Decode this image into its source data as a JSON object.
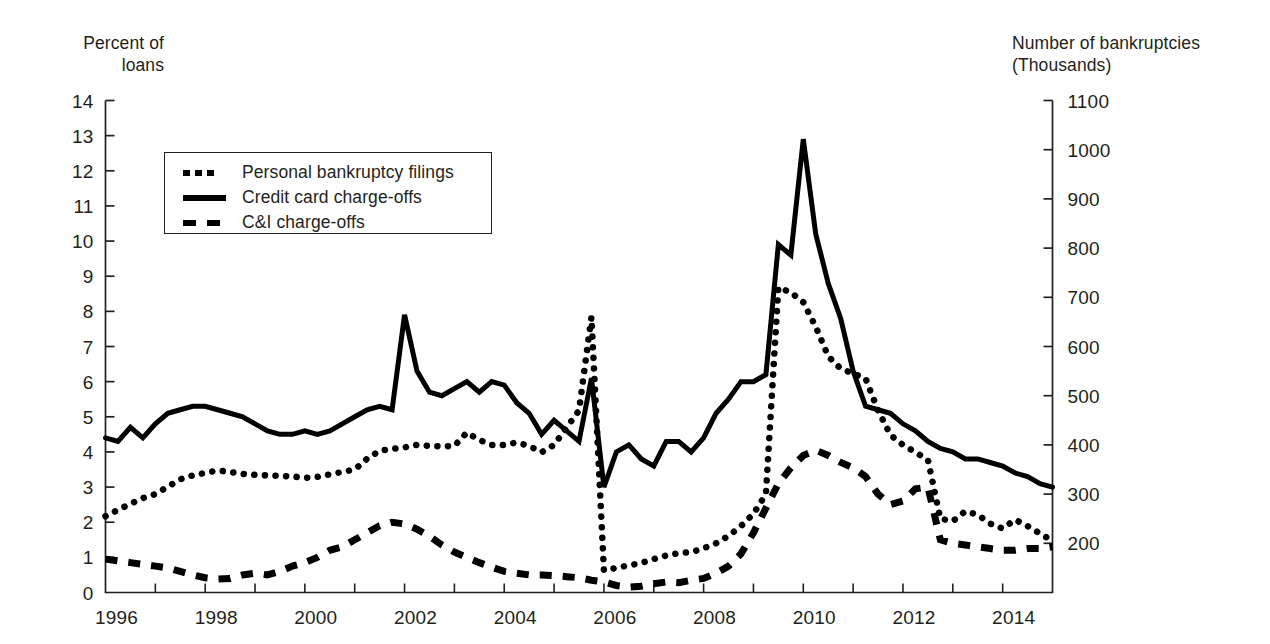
{
  "chart_data": {
    "type": "line",
    "title": "",
    "xlabel": "",
    "ylabel": "Percent of loans",
    "y2label": "Number of bankruptcies (Thousands)",
    "grid": false,
    "legend_position": "upper-left-inside",
    "xlim": [
      1996.0,
      2015.0
    ],
    "ylim": [
      0,
      14
    ],
    "y2lim": [
      100,
      1100
    ],
    "x_ticks": [
      1996,
      1998,
      2000,
      2002,
      2004,
      2006,
      2008,
      2010,
      2012,
      2014
    ],
    "x_tick_labels": [
      "1996",
      "1998",
      "2000",
      "2002",
      "2004",
      "2006",
      "2008",
      "2010",
      "2012",
      "2014"
    ],
    "x_minor_tick_interval": 1,
    "y_ticks": [
      0,
      1,
      2,
      3,
      4,
      5,
      6,
      7,
      8,
      9,
      10,
      11,
      12,
      13,
      14
    ],
    "y_tick_labels": [
      "0",
      "1",
      "2",
      "3",
      "4",
      "5",
      "6",
      "7",
      "8",
      "9",
      "10",
      "11",
      "12",
      "13",
      "14"
    ],
    "y2_ticks": [
      200,
      300,
      400,
      500,
      600,
      700,
      800,
      900,
      1000,
      1100
    ],
    "y2_tick_labels": [
      "200",
      "300",
      "400",
      "500",
      "600",
      "700",
      "800",
      "900",
      "1000",
      "1100"
    ],
    "series": [
      {
        "name": "Personal bankruptcy filings",
        "style": "dotted",
        "axis": "right",
        "units": "thousands",
        "x": [
          1996.0,
          1996.25,
          1996.5,
          1996.75,
          1997.0,
          1997.25,
          1997.5,
          1997.75,
          1998.0,
          1998.25,
          1998.5,
          1998.75,
          1999.0,
          1999.25,
          1999.5,
          1999.75,
          2000.0,
          2000.25,
          2000.5,
          2000.75,
          2001.0,
          2001.25,
          2001.5,
          2001.75,
          2002.0,
          2002.25,
          2002.5,
          2002.75,
          2003.0,
          2003.25,
          2003.5,
          2003.75,
          2004.0,
          2004.25,
          2004.5,
          2004.75,
          2005.0,
          2005.25,
          2005.5,
          2005.75,
          2006.0,
          2006.25,
          2006.5,
          2006.75,
          2007.0,
          2007.25,
          2007.5,
          2007.75,
          2008.0,
          2008.25,
          2008.5,
          2008.75,
          2009.0,
          2009.25,
          2009.5,
          2009.75,
          2010.0,
          2010.25,
          2010.5,
          2010.75,
          2011.0,
          2011.25,
          2011.5,
          2011.75,
          2012.0,
          2012.25,
          2012.5,
          2012.75,
          2013.0,
          2013.25,
          2013.5,
          2013.75,
          2014.0,
          2014.25,
          2014.5,
          2014.75,
          2015.0
        ],
        "y": [
          255,
          268,
          280,
          292,
          300,
          315,
          330,
          338,
          343,
          348,
          345,
          341,
          339,
          338,
          337,
          336,
          333,
          335,
          340,
          345,
          350,
          372,
          388,
          392,
          395,
          400,
          398,
          397,
          398,
          425,
          410,
          400,
          400,
          405,
          398,
          385,
          400,
          435,
          470,
          660,
          145,
          150,
          155,
          160,
          168,
          175,
          180,
          182,
          190,
          200,
          215,
          235,
          260,
          300,
          720,
          710,
          690,
          640,
          580,
          555,
          545,
          535,
          470,
          420,
          400,
          385,
          370,
          250,
          245,
          265,
          258,
          240,
          230,
          248,
          235,
          220,
          205
        ]
      },
      {
        "name": "Credit card charge-offs",
        "style": "solid",
        "axis": "left",
        "units": "percent",
        "x": [
          1996.0,
          1996.25,
          1996.5,
          1996.75,
          1997.0,
          1997.25,
          1997.5,
          1997.75,
          1998.0,
          1998.25,
          1998.5,
          1998.75,
          1999.0,
          1999.25,
          1999.5,
          1999.75,
          2000.0,
          2000.25,
          2000.5,
          2000.75,
          2001.0,
          2001.25,
          2001.5,
          2001.75,
          2002.0,
          2002.25,
          2002.5,
          2002.75,
          2003.0,
          2003.25,
          2003.5,
          2003.75,
          2004.0,
          2004.25,
          2004.5,
          2004.75,
          2005.0,
          2005.25,
          2005.5,
          2005.75,
          2006.0,
          2006.25,
          2006.5,
          2006.75,
          2007.0,
          2007.25,
          2007.5,
          2007.75,
          2008.0,
          2008.25,
          2008.5,
          2008.75,
          2009.0,
          2009.25,
          2009.5,
          2009.75,
          2010.0,
          2010.25,
          2010.5,
          2010.75,
          2011.0,
          2011.25,
          2011.5,
          2011.75,
          2012.0,
          2012.25,
          2012.5,
          2012.75,
          2013.0,
          2013.25,
          2013.5,
          2013.75,
          2014.0,
          2014.25,
          2014.5,
          2014.75,
          2015.0
        ],
        "y": [
          4.4,
          4.3,
          4.7,
          4.4,
          4.8,
          5.1,
          5.2,
          5.3,
          5.3,
          5.2,
          5.1,
          5.0,
          4.8,
          4.6,
          4.5,
          4.5,
          4.6,
          4.5,
          4.6,
          4.8,
          5.0,
          5.2,
          5.3,
          5.2,
          7.9,
          6.3,
          5.7,
          5.6,
          5.8,
          6.0,
          5.7,
          6.0,
          5.9,
          5.4,
          5.1,
          4.5,
          4.9,
          4.6,
          4.3,
          6.1,
          3.0,
          4.0,
          4.2,
          3.8,
          3.6,
          4.3,
          4.3,
          4.0,
          4.4,
          5.1,
          5.5,
          6.0,
          6.0,
          6.2,
          9.9,
          9.6,
          12.9,
          10.2,
          8.8,
          7.8,
          6.3,
          5.3,
          5.2,
          5.1,
          4.8,
          4.6,
          4.3,
          4.1,
          4.0,
          3.8,
          3.8,
          3.7,
          3.6,
          3.4,
          3.3,
          3.1,
          3.0
        ]
      },
      {
        "name": "C&I charge-offs",
        "style": "dashed",
        "axis": "left",
        "units": "percent",
        "x": [
          1996.0,
          1996.25,
          1996.5,
          1996.75,
          1997.0,
          1997.25,
          1997.5,
          1997.75,
          1998.0,
          1998.25,
          1998.5,
          1998.75,
          1999.0,
          1999.25,
          1999.5,
          1999.75,
          2000.0,
          2000.25,
          2000.5,
          2000.75,
          2001.0,
          2001.25,
          2001.5,
          2001.75,
          2002.0,
          2002.25,
          2002.5,
          2002.75,
          2003.0,
          2003.25,
          2003.5,
          2003.75,
          2004.0,
          2004.25,
          2004.5,
          2004.75,
          2005.0,
          2005.25,
          2005.5,
          2005.75,
          2006.0,
          2006.25,
          2006.5,
          2006.75,
          2007.0,
          2007.25,
          2007.5,
          2007.75,
          2008.0,
          2008.25,
          2008.5,
          2008.75,
          2009.0,
          2009.25,
          2009.5,
          2009.75,
          2010.0,
          2010.25,
          2010.5,
          2010.75,
          2011.0,
          2011.25,
          2011.5,
          2011.75,
          2012.0,
          2012.25,
          2012.5,
          2012.75,
          2013.0,
          2013.25,
          2013.5,
          2013.75,
          2014.0,
          2014.25,
          2014.5,
          2014.75,
          2015.0
        ],
        "y": [
          0.95,
          0.9,
          0.85,
          0.8,
          0.75,
          0.7,
          0.6,
          0.5,
          0.42,
          0.38,
          0.4,
          0.5,
          0.55,
          0.5,
          0.6,
          0.75,
          0.85,
          1.0,
          1.2,
          1.3,
          1.5,
          1.7,
          1.9,
          2.0,
          1.95,
          1.8,
          1.6,
          1.35,
          1.15,
          1.0,
          0.85,
          0.72,
          0.6,
          0.55,
          0.5,
          0.5,
          0.48,
          0.45,
          0.42,
          0.35,
          0.3,
          0.2,
          0.15,
          0.18,
          0.25,
          0.3,
          0.28,
          0.35,
          0.4,
          0.55,
          0.75,
          1.1,
          1.7,
          2.4,
          3.1,
          3.55,
          3.9,
          4.05,
          3.9,
          3.7,
          3.55,
          3.3,
          2.8,
          2.5,
          2.6,
          2.95,
          3.0,
          1.5,
          1.4,
          1.35,
          1.3,
          1.25,
          1.2,
          1.2,
          1.25,
          1.25,
          1.3
        ]
      }
    ]
  },
  "axes": {
    "left_title": "Percent of\nloans",
    "right_title": "Number of bankruptcies\n(Thousands)"
  },
  "legend": {
    "items": [
      {
        "label": "Personal bankruptcy filings",
        "style": "dotted"
      },
      {
        "label": "Credit card charge-offs",
        "style": "solid"
      },
      {
        "label": "C&I charge-offs",
        "style": "dashed"
      }
    ]
  }
}
